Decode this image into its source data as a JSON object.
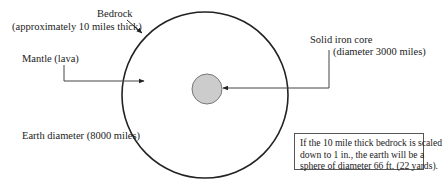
{
  "diagram": {
    "labels": {
      "bedrock": "Bedrock",
      "bedrock_detail": "(approximately 10 miles thick)",
      "mantle": "Mantle (lava)",
      "core": "Solid iron core",
      "core_detail": "(diameter 3000 miles)",
      "earth_diameter": "Earth diameter (8000 miles)"
    },
    "note": {
      "lines": [
        "If the 10 mile thick bedrock is scaled",
        "down to 1 in., the earth will be a",
        "sphere of diameter 66 ft. (22 yards)."
      ]
    },
    "shapes": {
      "earth_circle": {
        "cx": 205,
        "cy": 95,
        "r": 83,
        "stroke": "#222222",
        "fill": "#ffffff"
      },
      "core_circle": {
        "cx": 207,
        "cy": 89,
        "r": 15,
        "stroke": "#666666",
        "fill": "#cccccc"
      }
    },
    "colors": {
      "line": "#222222",
      "core_fill": "#cccccc"
    }
  }
}
